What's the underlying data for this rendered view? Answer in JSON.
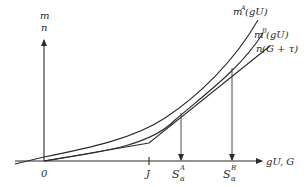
{
  "diagram": {
    "y_axis_labels": {
      "top": "m",
      "bottom": "n"
    },
    "x_axis_label": "gU, G",
    "origin_label": "0",
    "ticks": [
      {
        "id": "J",
        "label": "J"
      }
    ],
    "markers": [
      {
        "id": "S_alpha_A",
        "base": "S",
        "sub": "α",
        "sup": "A"
      },
      {
        "id": "S_alpha_B",
        "base": "S",
        "sub": "α",
        "sup": "B"
      }
    ],
    "curves": [
      {
        "id": "mA",
        "label_base": "m",
        "label_sup": "A",
        "label_arg": "(gU)"
      },
      {
        "id": "mB",
        "label_base": "m",
        "label_sup": "B",
        "label_arg": "(gU)"
      },
      {
        "id": "n",
        "label_base": "n",
        "label_arg": "(G + τ)"
      }
    ],
    "colors": {
      "stroke": "#2b2b2b",
      "background": "#ffffff"
    }
  }
}
